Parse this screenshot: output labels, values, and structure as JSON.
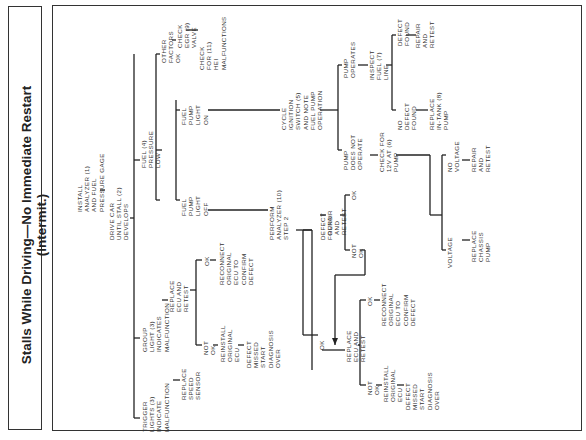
{
  "title": {
    "line1": "Stalls While Driving—No Immediate Restart",
    "line2": "(Intermit.)"
  },
  "nodes": {
    "install": "INSTALL\nANALYZER (1)\nAND FUEL\nPRESSURE GAGE",
    "drive": "DRIVE CAR\nUNTIL STALL (2)\nDEVELOPS",
    "trigger": "TRIGGER\nLIGHTS (3)\nINDICATE\nMALFUNCTION",
    "replace_speed": "REPLACE\nSPEED\nSENSOR",
    "group": "GROUP\nLIGHT (3)\nINDICATES\nMALFUNCTION",
    "replace_ecu1": "REPLACE\nECU AND\nRETEST",
    "ok1": "OK",
    "reconnect1": "RECONNECT\nORIGINAL\nECU TO\nCONFIRM\nDEFECT",
    "notok1": "NOT\nOK",
    "reinstall1": "REINSTALL\nORIGINAL\nECU",
    "missed1": "DEFECT\nMISSED\nSTART\nDIAGNOSIS\nOVER",
    "fuel_low": "FUEL (4)\nPRESSURE\nLOW",
    "other": "OTHER\nFACTORS\nOK",
    "egr": "CHECK\nEGR (9)\nVALVE",
    "hei": "CHECK\nFOR (11)\nHEI\nMALFUNCTIONS",
    "light_on": "FUEL\nPUMP\nLIGHT\nON",
    "light_off": "FUEL\nPUMP\nLIGHT\nOFF",
    "perform": "PERFORM\nANALYZER (10)\nSTEP 2",
    "defect_found_a": "DEFECT\nFOUND",
    "repair_a": "REPAIR\nAND\nRETEST",
    "ok_a": "OK",
    "notok_a": "NOT\nOK",
    "ok2": "OK",
    "replace_ecu2": "REPLACE\nECU AND\nRETEST",
    "ok3": "OK",
    "reconnect2": "RECONNECT\nORIGINAL\nECU TO\nCONFIRM\nDEFECT",
    "notok2": "NOT\nOK",
    "reinstall2": "REINSTALL\nORIGINAL\nECU",
    "missed2": "DEFECT\nMISSED\nSTART\nDIAGNOSIS\nOVER",
    "cycle": "CYCLE\nIGNITION\nSWITCH (5)\nAND NOTE\nFUEL PUMP\nOPERATION",
    "pump_ops": "PUMP\nOPERATES",
    "inspect": "INSPECT\nFUEL (7)\nLINE",
    "defect_found_b": "DEFECT\nFOUND",
    "repair_b": "REPAIR\nAND\nRETEST",
    "no_defect": "NO\nDEFECT\nFOUND",
    "replace_intank": "REPLACE\nIN-TANK (8)\nPUMP",
    "pump_not": "PUMP\nDOES NOT\nOPERATE",
    "check12v": "CHECK FOR\n12V AT (6)\nPUMP",
    "no_voltage": "NO\nVOLTAGE",
    "repair_c": "REPAIR\nAND\nRETEST",
    "voltage": "VOLTAGE",
    "replace_chassis": "REPLACE\nCHASSIS\nPUMP"
  }
}
